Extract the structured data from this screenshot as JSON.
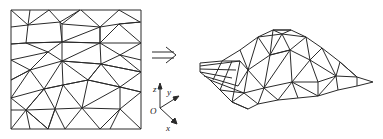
{
  "figure": {
    "colors": {
      "line": "#2a2a2a",
      "background": "#ffffff"
    },
    "left_panel": {
      "label": "2D triangular mesh (square domain)"
    },
    "arrow": {
      "glyph": "⇒",
      "meaning": "implies / maps to"
    },
    "axes": {
      "origin_label": "O",
      "x_label": "x",
      "y_label": "y",
      "z_label": "z"
    },
    "right_panel": {
      "label": "3D triangulated surface (mound)"
    }
  }
}
